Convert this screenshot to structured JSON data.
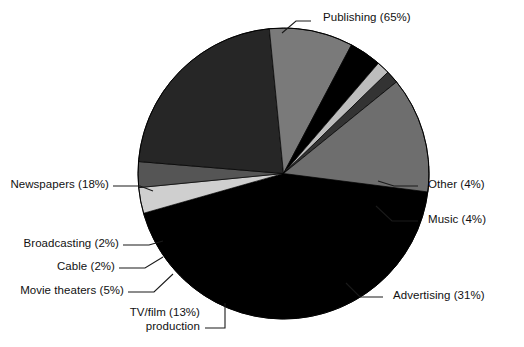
{
  "chart_data": {
    "type": "pie",
    "title": "",
    "subtitle": "",
    "xlabel": "",
    "ylabel": "",
    "legend_position": "callout-labels",
    "grid": false,
    "note": "Percentages sum to 140% because categories overlap; slice angles are drawn proportional to each value's share of the 140 total.",
    "total": 140,
    "categories": [
      "Publishing",
      "Other",
      "Music",
      "Advertising",
      "TV/film production",
      "Movie theaters",
      "Cable",
      "Broadcasting",
      "Newspapers"
    ],
    "values": [
      65,
      4,
      4,
      31,
      13,
      5,
      2,
      2,
      18
    ],
    "labels": [
      "Publishing (65%)",
      "Other (4%)",
      "Music (4%)",
      "Advertising (31%)",
      "TV/film (13%)",
      "Movie theaters (5%)",
      "Cable (2%)",
      "Broadcasting (2%)",
      "Newspapers (18%)"
    ],
    "slices": [
      {
        "name": "publishing",
        "label_line1": "Publishing (65%)",
        "label_line2": "",
        "value": 65,
        "percent": "65%",
        "color": "#000000"
      },
      {
        "name": "other",
        "label_line1": "Other (4%)",
        "label_line2": "",
        "value": 4,
        "percent": "4%",
        "color": "#cfcfcf"
      },
      {
        "name": "music",
        "label_line1": "Music (4%)",
        "label_line2": "",
        "value": 4,
        "percent": "4%",
        "color": "#555555"
      },
      {
        "name": "advertising",
        "label_line1": "Advertising (31%)",
        "label_line2": "",
        "value": 31,
        "percent": "31%",
        "color": "#262626"
      },
      {
        "name": "tv-film",
        "label_line1": "TV/film (13%)",
        "label_line2": "production",
        "value": 13,
        "percent": "13%",
        "color": "#7a7a7a"
      },
      {
        "name": "movie-theaters",
        "label_line1": "Movie theaters (5%)",
        "label_line2": "",
        "value": 5,
        "percent": "5%",
        "color": "#000000"
      },
      {
        "name": "cable",
        "label_line1": "Cable (2%)",
        "label_line2": "",
        "value": 2,
        "percent": "2%",
        "color": "#bdbdbd"
      },
      {
        "name": "broadcasting",
        "label_line1": "Broadcasting (2%)",
        "label_line2": "",
        "value": 2,
        "percent": "2%",
        "color": "#333333"
      },
      {
        "name": "newspapers",
        "label_line1": "Newspapers (18%)",
        "label_line2": "",
        "value": 18,
        "percent": "18%",
        "color": "#6e6e6e"
      }
    ],
    "colors": {
      "publishing": "#000000",
      "other": "#cfcfcf",
      "music": "#555555",
      "advertising": "#262626",
      "tv_film": "#7a7a7a",
      "movie_theaters": "#000000",
      "cable": "#bdbdbd",
      "broadcasting": "#333333",
      "newspapers": "#6e6e6e",
      "outline": "#000000",
      "background": "#ffffff",
      "text": "#111111",
      "leader": "#1a1a1a"
    }
  }
}
